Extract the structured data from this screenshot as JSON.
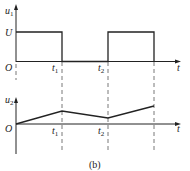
{
  "caption": "(b)",
  "top_plot": {
    "y_label": "u",
    "y_label_sub": "1",
    "x_label": "t",
    "origin_label": "O",
    "level_label": "U",
    "tick_labels": [
      {
        "main": "t",
        "sub": "1"
      },
      {
        "main": "t",
        "sub": "2"
      }
    ]
  },
  "bottom_plot": {
    "y_label": "u",
    "y_label_sub": "2",
    "x_label": "t",
    "origin_label": "O",
    "tick_labels": [
      {
        "main": "t",
        "sub": "1"
      },
      {
        "main": "t",
        "sub": "2"
      }
    ]
  },
  "colors": {
    "line": "#222222",
    "dash": "#555555"
  }
}
